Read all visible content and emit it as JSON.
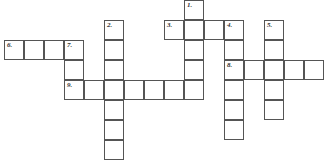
{
  "puzzle": {
    "type": "crossword",
    "cell_size": 20,
    "grid_origin": {
      "x": 4,
      "y": 0
    },
    "line_color": "#555555",
    "number_color": "#333333",
    "words": [
      {
        "number": "1",
        "label": "1.",
        "direction": "down",
        "row": 0,
        "col": 9,
        "length": 5
      },
      {
        "number": "2",
        "label": "2.",
        "direction": "down",
        "row": 1,
        "col": 5,
        "length": 7
      },
      {
        "number": "3",
        "label": "3.",
        "direction": "across",
        "row": 1,
        "col": 8,
        "length": 4
      },
      {
        "number": "4",
        "label": "4.",
        "direction": "down",
        "row": 1,
        "col": 11,
        "length": 6
      },
      {
        "number": "5",
        "label": "5.",
        "direction": "down",
        "row": 1,
        "col": 13,
        "length": 5
      },
      {
        "number": "6",
        "label": "6.",
        "direction": "across",
        "row": 2,
        "col": 0,
        "length": 4
      },
      {
        "number": "7",
        "label": "7.",
        "direction": "down",
        "row": 2,
        "col": 3,
        "length": 3
      },
      {
        "number": "8",
        "label": "8.",
        "direction": "across",
        "row": 3,
        "col": 11,
        "length": 5
      },
      {
        "number": "9",
        "label": "9.",
        "direction": "across",
        "row": 4,
        "col": 3,
        "length": 7
      }
    ]
  }
}
